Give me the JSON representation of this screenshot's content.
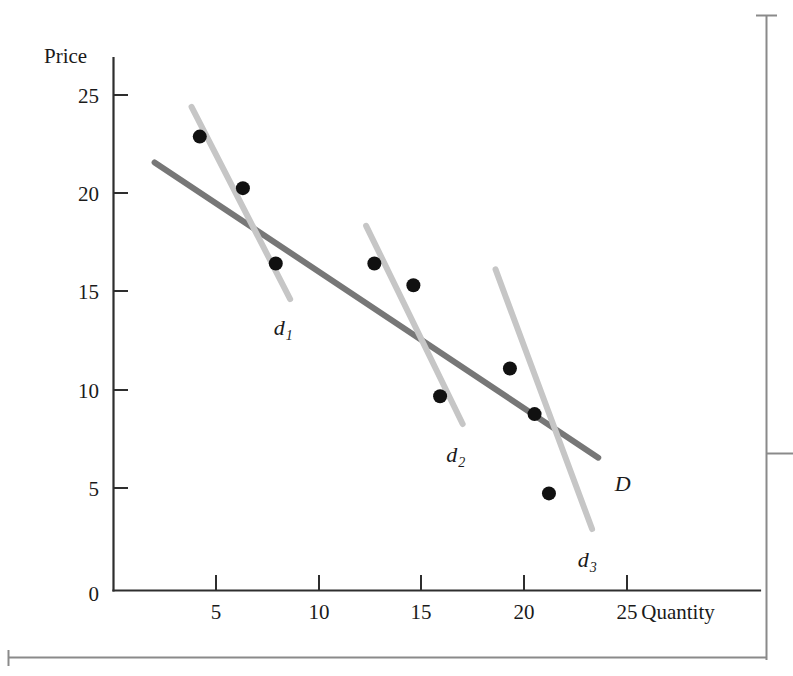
{
  "figure": {
    "kind": "economics-demand-curve-figure",
    "background_color": "#ffffff"
  },
  "chart_data": {
    "type": "scatter",
    "title": "",
    "subtitle": "",
    "xlabel": "Quantity",
    "ylabel": "Price",
    "xlim": [
      0,
      27.5
    ],
    "ylim": [
      0,
      27
    ],
    "grid": false,
    "legend": "inline-curve-labels",
    "xticks": [
      5,
      10,
      15,
      20,
      25
    ],
    "xtick_labels": [
      "5",
      "10",
      "15",
      "20",
      "25"
    ],
    "yticks": [
      5,
      10,
      15,
      20,
      25
    ],
    "ytick_labels": [
      "5",
      "10",
      "15",
      "20",
      "25"
    ],
    "origin_label": "0",
    "points": [
      {
        "x": 4.2,
        "y": 22.9,
        "group": "d1"
      },
      {
        "x": 6.3,
        "y": 20.3,
        "group": "d1"
      },
      {
        "x": 7.9,
        "y": 16.5,
        "group": "d1"
      },
      {
        "x": 12.7,
        "y": 16.5,
        "group": "d2"
      },
      {
        "x": 14.6,
        "y": 15.4,
        "group": "d2"
      },
      {
        "x": 15.9,
        "y": 9.8,
        "group": "d2"
      },
      {
        "x": 19.3,
        "y": 11.2,
        "group": "d3"
      },
      {
        "x": 20.5,
        "y": 8.9,
        "group": "d3"
      },
      {
        "x": 21.2,
        "y": 4.9,
        "group": "d3"
      }
    ],
    "point_radius_px": 7,
    "series": [
      {
        "name": "D",
        "label": "D",
        "label_sub": "",
        "role": "long-run-demand",
        "color": "#777777",
        "width_px": 6,
        "x0": 2.0,
        "y0": 21.6,
        "x1": 23.6,
        "y1": 6.7,
        "label_x": 24.4,
        "label_y": 5.0
      },
      {
        "name": "d1",
        "label": "d",
        "label_sub": "1",
        "role": "short-run-demand-1",
        "color": "#c6c6c6",
        "width_px": 6,
        "x0": 3.8,
        "y0": 24.4,
        "x1": 8.6,
        "y1": 14.7,
        "label_x": 7.8,
        "label_y": 12.9
      },
      {
        "name": "d2",
        "label": "d",
        "label_sub": "2",
        "role": "short-run-demand-2",
        "color": "#c6c6c6",
        "width_px": 6,
        "x0": 12.3,
        "y0": 18.4,
        "x1": 17.0,
        "y1": 8.4,
        "label_x": 16.2,
        "label_y": 6.5
      },
      {
        "name": "d3",
        "label": "d",
        "label_sub": "3",
        "role": "short-run-demand-3",
        "color": "#c6c6c6",
        "width_px": 6,
        "x0": 18.6,
        "y0": 16.2,
        "x1": 23.3,
        "y1": 3.1,
        "label_x": 22.6,
        "label_y": 1.2
      }
    ]
  },
  "colors": {
    "axis": "#2e2e2e",
    "point": "#111111",
    "demand_long_run": "#777777",
    "demand_short_run": "#c6c6c6",
    "page_frame": "#8a8a8a",
    "text": "#1a1a1a"
  }
}
